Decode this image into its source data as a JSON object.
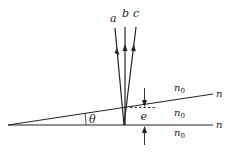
{
  "diagram": {
    "title": "",
    "rays": [
      {
        "label": "a",
        "direction": "incident"
      },
      {
        "label": "b",
        "direction": "reflected"
      },
      {
        "label": "c",
        "direction": "reflected"
      }
    ],
    "angle_label": "θ",
    "thickness_label": "e",
    "media": {
      "top": "n₀",
      "middle": "n₀",
      "bottom": "n₀"
    },
    "interfaces": {
      "upper": "n",
      "lower": "n"
    },
    "colors": {
      "line": "#222222",
      "background": "#ffffff"
    }
  }
}
